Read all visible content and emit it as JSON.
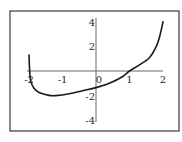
{
  "chart_data": {
    "type": "line",
    "title": "",
    "xlabel": "",
    "ylabel": "",
    "xlim": [
      -2,
      2
    ],
    "ylim": [
      -4,
      4
    ],
    "grid": false,
    "legend": null,
    "x_ticks": [
      -2,
      -1,
      0,
      1,
      2
    ],
    "y_ticks": [
      -4,
      -2,
      2,
      4
    ],
    "x_tick_labels": [
      "-2",
      "-1",
      "0",
      "1",
      "2"
    ],
    "y_tick_labels": [
      "-4",
      "-2",
      "2",
      "4"
    ],
    "series": [
      {
        "name": "f(x)",
        "color": "#1a1a1a",
        "x": [
          -2.0,
          -1.98,
          -1.95,
          -1.85,
          -1.7,
          -1.4,
          -1.2,
          -0.8,
          -0.4,
          0.0,
          0.4,
          0.8,
          1.0,
          1.3,
          1.6,
          1.8,
          1.9,
          2.0
        ],
        "y": [
          1.3,
          0.0,
          -0.8,
          -1.4,
          -1.75,
          -1.98,
          -2.0,
          -1.85,
          -1.6,
          -1.35,
          -1.0,
          -0.45,
          0.0,
          0.5,
          1.1,
          2.0,
          2.8,
          4.0
        ]
      }
    ]
  },
  "layout": {
    "frame": {
      "x": 10,
      "y": 11,
      "w": 169,
      "h": 120
    },
    "origin_px": {
      "x": 96,
      "y": 71
    },
    "px_per_unit": {
      "x": 33.5,
      "y": 12.3
    },
    "y_axis_extent_px": [
      18,
      122
    ],
    "x_axis_extent_px": [
      27,
      163
    ]
  }
}
